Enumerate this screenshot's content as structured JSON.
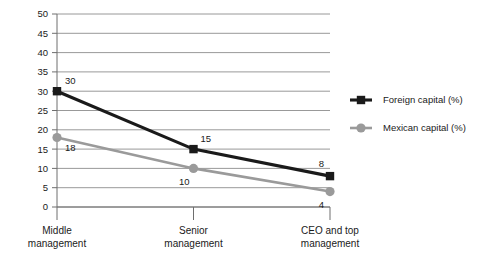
{
  "chart_data": {
    "type": "line",
    "title": "",
    "xlabel": "",
    "ylabel": "",
    "categories": [
      "Middle management",
      "Senior management",
      "CEO and top management"
    ],
    "category_lines": [
      [
        "Middle",
        "management"
      ],
      [
        "Senior",
        "management"
      ],
      [
        "CEO and top",
        "management"
      ]
    ],
    "series": [
      {
        "name": "Foreign capital (%)",
        "values": [
          30,
          15,
          8
        ],
        "color": "#1a1a1a",
        "marker": "square"
      },
      {
        "name": "Mexican capital (%)",
        "values": [
          18,
          10,
          4
        ],
        "color": "#9a9a9a",
        "marker": "circle"
      }
    ],
    "ylim": [
      0,
      50
    ],
    "ytick_step": 5,
    "yticks": [
      "0",
      "5",
      "10",
      "15",
      "20",
      "25",
      "30",
      "35",
      "40",
      "45",
      "50"
    ],
    "grid": true,
    "legend_position": "right",
    "point_labels": [
      {
        "text": "30",
        "series": 0,
        "index": 0
      },
      {
        "text": "15",
        "series": 0,
        "index": 1
      },
      {
        "text": "8",
        "series": 0,
        "index": 2
      },
      {
        "text": "18",
        "series": 1,
        "index": 0
      },
      {
        "text": "10",
        "series": 1,
        "index": 1
      },
      {
        "text": "4",
        "series": 1,
        "index": 2
      }
    ]
  },
  "colors": {
    "grid": "#8d8d8d",
    "axis": "#6e6e6e",
    "foreign": "#1a1a1a",
    "mexican": "#9a9a9a"
  }
}
